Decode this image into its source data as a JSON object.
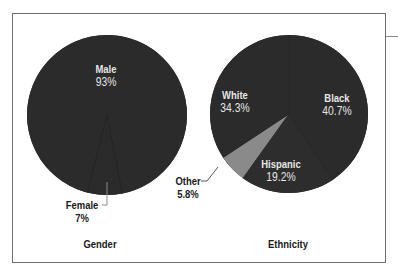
{
  "chart_data": [
    {
      "type": "pie",
      "title": "Gender",
      "categories": [
        "Male",
        "Female"
      ],
      "values": [
        93,
        7
      ],
      "labels": [
        "93%",
        "7%"
      ],
      "colors": [
        "#2b2b2b",
        "#2b2b2b"
      ]
    },
    {
      "type": "pie",
      "title": "Ethnicity",
      "categories": [
        "Black",
        "Hispanic",
        "Other",
        "White"
      ],
      "values": [
        40.7,
        19.2,
        5.8,
        34.3
      ],
      "labels": [
        "40.7%",
        "19.2%",
        "5.8%",
        "34.3%"
      ],
      "colors": [
        "#2b2b2b",
        "#2d2d2d",
        "#8a8a8a",
        "#2b2b2b"
      ]
    }
  ],
  "gender": {
    "title": "Gender",
    "male": {
      "name": "Male",
      "pct": "93%"
    },
    "female": {
      "name": "Female",
      "pct": "7%"
    }
  },
  "ethnicity": {
    "title": "Ethnicity",
    "white": {
      "name": "White",
      "pct": "34.3%"
    },
    "black": {
      "name": "Black",
      "pct": "40.7%"
    },
    "hispanic": {
      "name": "Hispanic",
      "pct": "19.2%"
    },
    "other": {
      "name": "Other",
      "pct": "5.8%"
    }
  }
}
